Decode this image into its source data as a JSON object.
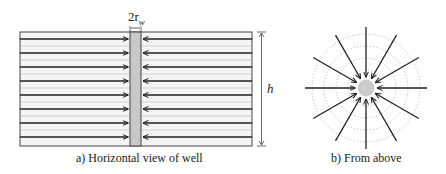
{
  "figure": {
    "panel_a": {
      "caption": "a) Horizontal view of well",
      "well_width_label": "2r",
      "well_width_subscript": "w",
      "height_label": "h",
      "flow_lines": 8
    },
    "panel_b": {
      "caption": "b) From above",
      "radial_arrows": 12,
      "dotted_rings": 4
    },
    "colors": {
      "line": "#222222",
      "well_fill": "#c8c8c8",
      "layer_fill": "#f4f4f4",
      "dotted": "#aaaaaa"
    }
  }
}
